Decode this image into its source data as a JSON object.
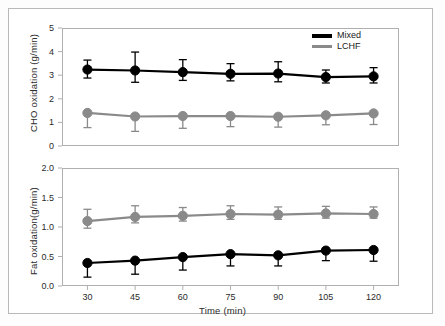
{
  "figure": {
    "background": "#ffffff",
    "border_color": "#b9b9b9"
  },
  "colors": {
    "mixed": "#000000",
    "lchf": "#8a8a8a",
    "axis": "#b0b0b0",
    "text": "#2b2b2b"
  },
  "legend": {
    "position": "top-right-of-upper-panel",
    "entries": [
      {
        "label": "Mixed",
        "color": "#000000"
      },
      {
        "label": "LCHF",
        "color": "#8a8a8a"
      }
    ]
  },
  "chart_data": [
    {
      "type": "line",
      "panel": "upper",
      "title": "",
      "xlabel": "",
      "ylabel": "CHO oxidation (g/min)",
      "x": [
        30,
        45,
        60,
        75,
        90,
        105,
        120
      ],
      "xtick_labels": [
        "30",
        "45",
        "60",
        "75",
        "90",
        "105",
        "120"
      ],
      "xlim": [
        22,
        128
      ],
      "ylim": [
        0,
        5
      ],
      "ytick_labels": [
        "0",
        "1",
        "2",
        "3",
        "4",
        "5"
      ],
      "yticks": [
        0,
        1,
        2,
        3,
        4,
        5
      ],
      "grid": false,
      "error_bars": true,
      "series": [
        {
          "name": "Mixed",
          "color": "#000000",
          "marker": "circle",
          "values": [
            3.24,
            3.2,
            3.13,
            3.06,
            3.07,
            2.92,
            2.95
          ],
          "err_low": [
            0.36,
            0.5,
            0.35,
            0.3,
            0.35,
            0.25,
            0.28
          ],
          "err_high": [
            0.4,
            0.78,
            0.53,
            0.43,
            0.5,
            0.3,
            0.37
          ]
        },
        {
          "name": "LCHF",
          "color": "#8a8a8a",
          "marker": "circle",
          "values": [
            1.4,
            1.25,
            1.27,
            1.27,
            1.24,
            1.3,
            1.38
          ],
          "err_low": [
            0.62,
            0.63,
            0.52,
            0.45,
            0.44,
            0.4,
            0.47
          ],
          "err_high": [
            0.0,
            0.0,
            0.0,
            0.0,
            0.0,
            0.0,
            0.0
          ]
        }
      ]
    },
    {
      "type": "line",
      "panel": "lower",
      "title": "",
      "xlabel": "Time  (min)",
      "ylabel": "Fat oxidation(g/min)",
      "x": [
        30,
        45,
        60,
        75,
        90,
        105,
        120
      ],
      "xtick_labels": [
        "30",
        "45",
        "60",
        "75",
        "90",
        "105",
        "120"
      ],
      "xlim": [
        22,
        128
      ],
      "ylim": [
        0.0,
        2.0
      ],
      "ytick_labels": [
        "0.0",
        "0.5",
        "1.0",
        "1.5",
        "2.0"
      ],
      "yticks": [
        0.0,
        0.5,
        1.0,
        1.5,
        2.0
      ],
      "grid": false,
      "error_bars": true,
      "series": [
        {
          "name": "LCHF",
          "color": "#8a8a8a",
          "marker": "circle",
          "values": [
            1.1,
            1.17,
            1.19,
            1.22,
            1.21,
            1.23,
            1.22
          ],
          "err_low": [
            0.12,
            0.1,
            0.09,
            0.09,
            0.08,
            0.08,
            0.07
          ],
          "err_high": [
            0.2,
            0.19,
            0.14,
            0.14,
            0.13,
            0.12,
            0.12
          ]
        },
        {
          "name": "Mixed",
          "color": "#000000",
          "marker": "circle",
          "values": [
            0.39,
            0.43,
            0.49,
            0.54,
            0.52,
            0.6,
            0.61
          ],
          "err_low": [
            0.24,
            0.23,
            0.22,
            0.2,
            0.18,
            0.17,
            0.19
          ],
          "err_high": [
            0.0,
            0.0,
            0.0,
            0.0,
            0.0,
            0.0,
            0.0
          ]
        }
      ]
    }
  ]
}
